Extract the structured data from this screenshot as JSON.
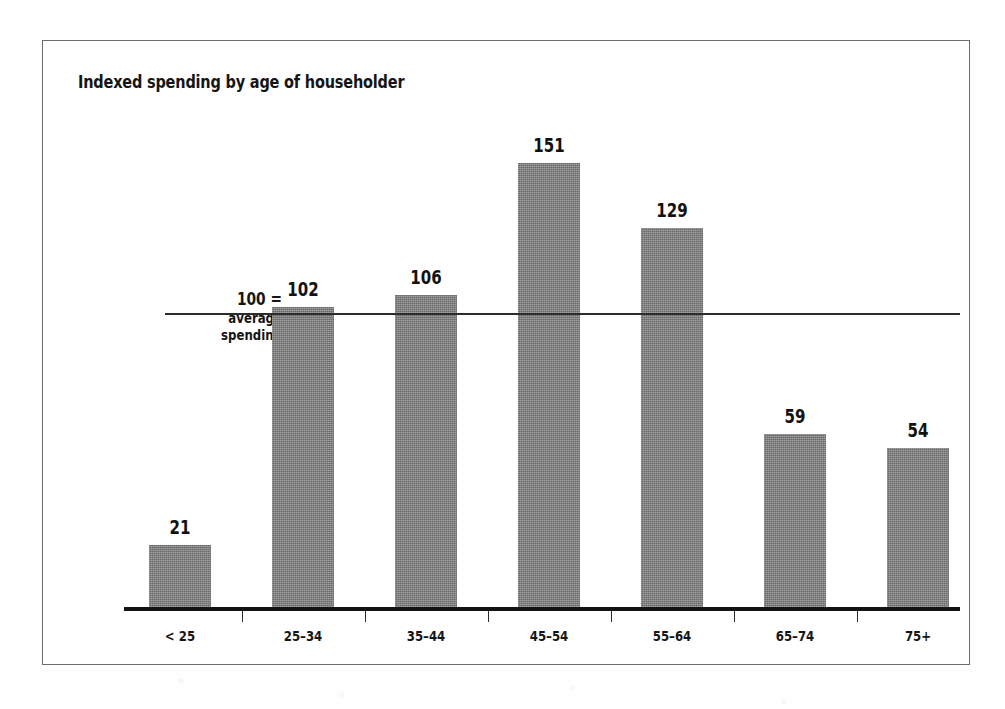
{
  "chart_data": {
    "type": "bar",
    "title": "Indexed spending by age of householder",
    "xlabel": "",
    "ylabel": "",
    "categories": [
      "< 25",
      "25–34",
      "35–44",
      "45–54",
      "55–64",
      "65–74",
      "75+"
    ],
    "values": [
      21,
      102,
      106,
      151,
      129,
      59,
      54
    ],
    "value_labels": [
      "21",
      "102",
      "106",
      "151",
      "129",
      "59",
      "54"
    ],
    "reference_line": {
      "value": 100,
      "label_line1": "100 =",
      "label_line2": "average",
      "label_line3": "spending"
    },
    "ylim": [
      0,
      173
    ],
    "grid": false,
    "legend": null,
    "bar_color": "#7d7d7d",
    "axis_color": "#131313",
    "text_color": "#151515"
  },
  "frame": {
    "border_color": "#6d6d6d",
    "background": "#ffffff"
  }
}
